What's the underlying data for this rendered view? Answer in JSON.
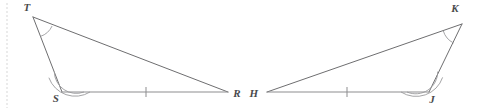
{
  "figure": {
    "background_color": "#ffffff",
    "line_color": "#6e6e70",
    "base_line_color": "#8d8d8f",
    "arc_color": "#9a9a9c",
    "label_color": "#4a4a4c",
    "edge_rule_color": "#e3e3e3"
  },
  "left_triangle": {
    "name": "triangle-TSR",
    "vertices": [
      {
        "label": "T",
        "point_x": 33,
        "point_y": 17,
        "label_x": 27,
        "label_y": 11,
        "arc_count": 1
      },
      {
        "label": "S",
        "point_x": 62,
        "point_y": 92,
        "label_x": 56,
        "label_y": 102,
        "arc_count": 2
      },
      {
        "label": "R",
        "point_x": 228,
        "point_y": 92,
        "label_x": 237,
        "label_y": 97,
        "arc_count": 0
      }
    ],
    "sides": [
      {
        "name": "side-TS",
        "from": "T",
        "to": "S",
        "ticks": 0
      },
      {
        "name": "side-TR",
        "from": "T",
        "to": "R",
        "ticks": 0
      },
      {
        "name": "side-SR",
        "from": "S",
        "to": "R",
        "ticks": 1,
        "tick_x": 146,
        "tick_y": 92
      }
    ]
  },
  "right_triangle": {
    "name": "triangle-KJH",
    "vertices": [
      {
        "label": "K",
        "point_x": 462,
        "point_y": 24,
        "label_x": 455,
        "label_y": 12,
        "arc_count": 1
      },
      {
        "label": "J",
        "point_x": 429,
        "point_y": 92,
        "label_x": 432,
        "label_y": 103,
        "arc_count": 2
      },
      {
        "label": "H",
        "point_x": 267,
        "point_y": 92,
        "label_x": 254,
        "label_y": 97,
        "arc_count": 0
      }
    ],
    "sides": [
      {
        "name": "side-KJ",
        "from": "K",
        "to": "J",
        "ticks": 0
      },
      {
        "name": "side-KH",
        "from": "K",
        "to": "H",
        "ticks": 0
      },
      {
        "name": "side-HJ",
        "from": "H",
        "to": "J",
        "ticks": 1,
        "tick_x": 347,
        "tick_y": 92
      }
    ]
  },
  "edge_rule": {
    "name": "left-margin-rule",
    "x": 7,
    "y_start": 3,
    "y_end": 108
  }
}
